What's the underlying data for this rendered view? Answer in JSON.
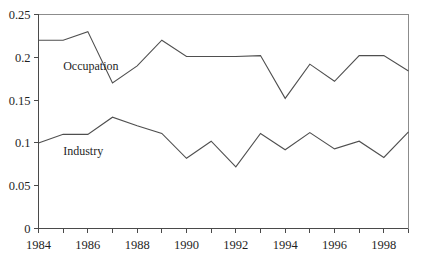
{
  "chart_data": {
    "type": "line",
    "title": "",
    "subtitle": "",
    "xlabel": "",
    "ylabel": "",
    "x": [
      1984,
      1985,
      1986,
      1987,
      1988,
      1989,
      1990,
      1991,
      1992,
      1993,
      1994,
      1995,
      1996,
      1997,
      1998,
      1999
    ],
    "xlim": [
      1984,
      1999
    ],
    "ylim": [
      0,
      0.25
    ],
    "grid": false,
    "legend_position": "inline-annotation",
    "x_tick_values": [
      1984,
      1985,
      1986,
      1987,
      1988,
      1989,
      1990,
      1991,
      1992,
      1993,
      1994,
      1995,
      1996,
      1997,
      1998,
      1999
    ],
    "x_tick_labels": [
      "1984",
      "",
      "1986",
      "",
      "1988",
      "",
      "1990",
      "",
      "1992",
      "",
      "1994",
      "",
      "1996",
      "",
      "1998",
      ""
    ],
    "y_tick_values": [
      0,
      0.05,
      0.1,
      0.15,
      0.2,
      0.25
    ],
    "y_tick_labels": [
      "0",
      "0.05",
      "0.1",
      "0.15",
      "0.2",
      "0.25"
    ],
    "series": [
      {
        "name": "Occupation",
        "color": "#4f4f4f",
        "label_x": 1985.0,
        "label_y": 0.185,
        "values": [
          0.22,
          0.22,
          0.23,
          0.17,
          0.19,
          0.22,
          0.201,
          0.201,
          0.201,
          0.202,
          0.152,
          0.192,
          0.172,
          0.202,
          0.202,
          0.184
        ]
      },
      {
        "name": "Industry",
        "color": "#4f4f4f",
        "label_x": 1985.0,
        "label_y": 0.0855,
        "values": [
          0.1,
          0.11,
          0.11,
          0.13,
          0.12,
          0.111,
          0.082,
          0.102,
          0.072,
          0.111,
          0.092,
          0.112,
          0.093,
          0.102,
          0.083,
          0.113
        ]
      }
    ]
  },
  "axes": {
    "y_axis_name": "value-axis",
    "x_axis_name": "year-axis"
  }
}
